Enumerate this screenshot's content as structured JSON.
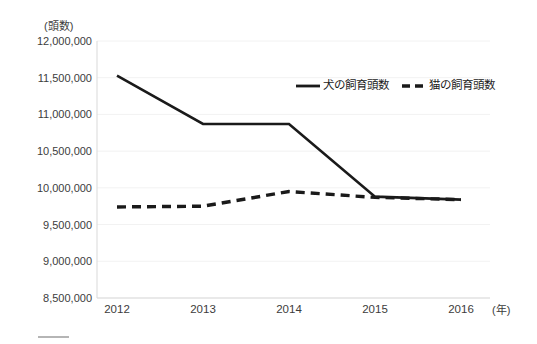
{
  "chart_data": {
    "type": "line",
    "title": "",
    "subtitle": "",
    "xlabel": "(年)",
    "ylabel": "(頭数)",
    "categories": [
      "2012",
      "2013",
      "2014",
      "2015",
      "2016"
    ],
    "x": [
      2012,
      2013,
      2014,
      2015,
      2016
    ],
    "series": [
      {
        "name": "犬の飼育頭数",
        "style": "solid",
        "color": "#1a1a1a",
        "values": [
          11530000,
          10870000,
          10870000,
          9880000,
          9840000
        ]
      },
      {
        "name": "猫の飼育頭数",
        "style": "dashed",
        "color": "#1a1a1a",
        "values": [
          9740000,
          9750000,
          9950000,
          9870000,
          9840000
        ]
      }
    ],
    "ylim": [
      8500000,
      12000000
    ],
    "ytick_values": [
      8500000,
      9000000,
      9500000,
      10000000,
      10500000,
      11000000,
      11500000,
      12000000
    ],
    "ytick_labels": [
      "8,500,000",
      "9,000,000",
      "9,500,000",
      "10,000,000",
      "10,500,000",
      "11,000,000",
      "11,500,000",
      "12,000,000"
    ],
    "grid": true,
    "grid_axis": "y",
    "grid_color": "#f2f2f2",
    "axis_color": "#d9d9d9",
    "legend_position": "upper-right-inside",
    "background": "#ffffff"
  },
  "axis": {
    "y_unit": "(頭数)",
    "x_unit": "(年)"
  },
  "legend": {
    "items": [
      {
        "label": "犬の飼育頭数",
        "style": "solid"
      },
      {
        "label": "猫の飼育頭数",
        "style": "dashed"
      }
    ]
  }
}
